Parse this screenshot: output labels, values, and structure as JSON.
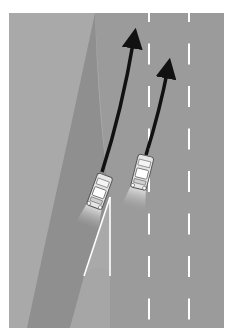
{
  "diagram": {
    "caption": "",
    "colors": {
      "background": "#ffffff",
      "shoulder": "#a9a9a9",
      "road": "#9b9b9b",
      "ramp": "#8f8f8f",
      "gore": "#a6a6a6",
      "lane_marking": "#ffffff",
      "path_arrow": "#111111",
      "car_body": "#e6e6e6",
      "car_outline": "#555555",
      "headlight_glow": "#cfcfcf"
    },
    "elements": [
      {
        "name": "shoulder",
        "label": "shoulder area"
      },
      {
        "name": "main-road",
        "label": "main road, 2 lanes"
      },
      {
        "name": "on-ramp",
        "label": "on-ramp"
      },
      {
        "name": "gore-area",
        "label": "gore area"
      },
      {
        "name": "lane-divider-1",
        "label": "dashed lane line"
      },
      {
        "name": "lane-divider-2",
        "label": "dashed lane line"
      },
      {
        "name": "car-ramp",
        "label": "car on ramp"
      },
      {
        "name": "car-lane",
        "label": "car in merge lane"
      },
      {
        "name": "path-arrow-ramp",
        "label": "trajectory of ramp car"
      },
      {
        "name": "path-arrow-lane",
        "label": "trajectory of lane car"
      }
    ]
  }
}
